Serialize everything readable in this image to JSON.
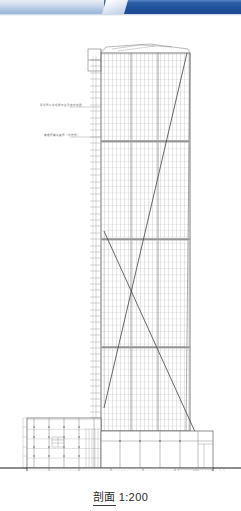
{
  "window": {
    "chrome_bar_color": "#20519c",
    "chrome_tab_color": "#e3ebf6"
  },
  "caption": {
    "label_cjk": "剖面",
    "scale": "1:200",
    "full": "剖面 1:200"
  },
  "drawing": {
    "type": "architectural-building-section",
    "title": "剖面 1:200",
    "paper_color": "#ffffff",
    "line_color": "#555555",
    "scale_ratio": "1:200",
    "annotations": [
      {
        "id": "anno-upper",
        "text": "屋顶层公共观景平台及空中花园",
        "x": 40,
        "y": 105
      },
      {
        "id": "anno-lower",
        "text": "避难层兼设备层（机电层）",
        "x": 44,
        "y": 135
      }
    ],
    "tower": {
      "name": "high-rise-tower",
      "left": 101,
      "right": 190,
      "top": 31,
      "bottom": 415,
      "bay_count": 22,
      "floor_count": 60,
      "mech_floor_rows": [
        14,
        29,
        45
      ],
      "crown_label": "屋顶构架"
    },
    "podium": {
      "name": "low-rise-podium",
      "left": 27,
      "right": 101,
      "top": 402,
      "bottom": 452,
      "floor_count": 5,
      "room_labels": [
        "门厅",
        "办公",
        "会议",
        "展厅",
        "设备"
      ]
    },
    "basement": {
      "name": "basement-parking",
      "left": 27,
      "right": 213,
      "top": 452,
      "bottom": 472,
      "level_count": 2,
      "level_labels": [
        "B1 停车库",
        "B2 停车库"
      ],
      "car_count_per_level": 14
    },
    "section_line": {
      "name": "diagonal-section-indicator",
      "path": "V-shaped leader from lower-left to upper-right then down to lower-right",
      "vertices": [
        [
          104,
          392
        ],
        [
          187,
          37
        ],
        [
          104,
          215
        ],
        [
          196,
          418
        ]
      ]
    },
    "ground_line": {
      "y": 452,
      "left": 0,
      "right": 241
    }
  }
}
